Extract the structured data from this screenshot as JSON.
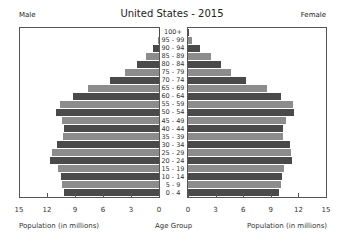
{
  "chart_data": {
    "type": "bar",
    "subtype": "population-pyramid",
    "title": "United States - 2015",
    "left_label": "Male",
    "right_label": "Female",
    "xlabel_left": "Population (in millions)",
    "xlabel_center": "Age Group",
    "xlabel_right": "Population (in millions)",
    "xlim": [
      0,
      15
    ],
    "ticks": [
      "15",
      "12",
      "9",
      "6",
      "3",
      "0"
    ],
    "ticks_right": [
      "0",
      "3",
      "6",
      "9",
      "12",
      "15"
    ],
    "categories": [
      "0 - 4",
      "5 - 9",
      "10 - 14",
      "15 - 19",
      "20 - 24",
      "25 - 29",
      "30 - 34",
      "35 - 39",
      "40 - 44",
      "45 - 49",
      "50 - 54",
      "55 - 59",
      "60 - 64",
      "65 - 69",
      "70 - 74",
      "75 - 79",
      "80 - 84",
      "85 - 89",
      "90 - 94",
      "95 - 99",
      "100+"
    ],
    "series": [
      {
        "name": "Male",
        "values": [
          10.2,
          10.4,
          10.5,
          10.8,
          11.7,
          11.5,
          10.9,
          10.3,
          10.2,
          10.4,
          11.0,
          10.6,
          9.2,
          7.6,
          5.2,
          3.6,
          2.4,
          1.4,
          0.6,
          0.1,
          0.02
        ]
      },
      {
        "name": "Female",
        "values": [
          9.8,
          10.0,
          10.1,
          10.3,
          11.1,
          11.0,
          10.9,
          10.2,
          10.2,
          10.5,
          11.4,
          11.3,
          10.0,
          8.5,
          6.2,
          4.6,
          3.5,
          2.5,
          1.3,
          0.4,
          0.06
        ]
      }
    ],
    "colors": {
      "dark": "#4a4a4a",
      "light": "#8c8c8c"
    },
    "grid": false
  }
}
